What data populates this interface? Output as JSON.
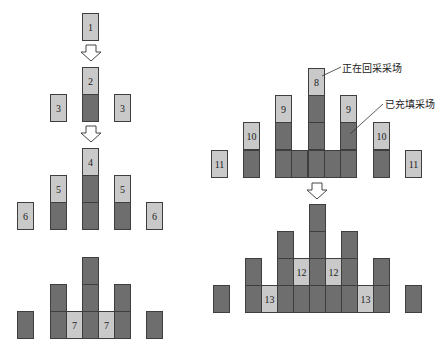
{
  "colors": {
    "active_stope": "#c9c9c9",
    "filled_stope": "#6e6e6e",
    "border": "#3e3e3e"
  },
  "left_diagram": {
    "stage1": {
      "cells": [
        {
          "x": 82,
          "y": 13,
          "fill": "light",
          "label": "1"
        }
      ]
    },
    "stage2": {
      "cells": [
        {
          "x": 82,
          "y": 67,
          "fill": "light",
          "label": "2"
        },
        {
          "x": 82,
          "y": 94,
          "fill": "dark",
          "label": ""
        },
        {
          "x": 50,
          "y": 94,
          "fill": "light",
          "label": "3"
        },
        {
          "x": 114,
          "y": 94,
          "fill": "light",
          "label": "3"
        }
      ]
    },
    "stage3": {
      "cells": [
        {
          "x": 82,
          "y": 148,
          "fill": "light",
          "label": "4"
        },
        {
          "x": 82,
          "y": 175,
          "fill": "dark",
          "label": ""
        },
        {
          "x": 82,
          "y": 202,
          "fill": "dark",
          "label": ""
        },
        {
          "x": 50,
          "y": 175,
          "fill": "light",
          "label": "5"
        },
        {
          "x": 50,
          "y": 202,
          "fill": "dark",
          "label": ""
        },
        {
          "x": 114,
          "y": 175,
          "fill": "light",
          "label": "5"
        },
        {
          "x": 114,
          "y": 202,
          "fill": "dark",
          "label": ""
        },
        {
          "x": 17,
          "y": 202,
          "fill": "light",
          "label": "6"
        },
        {
          "x": 146,
          "y": 202,
          "fill": "light",
          "label": "6"
        }
      ]
    },
    "stage4": {
      "cells": [
        {
          "x": 82,
          "y": 257,
          "fill": "dark",
          "label": ""
        },
        {
          "x": 82,
          "y": 284,
          "fill": "dark",
          "label": ""
        },
        {
          "x": 82,
          "y": 311,
          "fill": "dark",
          "label": ""
        },
        {
          "x": 50,
          "y": 284,
          "fill": "dark",
          "label": ""
        },
        {
          "x": 50,
          "y": 311,
          "fill": "dark",
          "label": ""
        },
        {
          "x": 114,
          "y": 284,
          "fill": "dark",
          "label": ""
        },
        {
          "x": 114,
          "y": 311,
          "fill": "dark",
          "label": ""
        },
        {
          "x": 66,
          "y": 311,
          "fill": "light",
          "label": "7"
        },
        {
          "x": 98,
          "y": 311,
          "fill": "light",
          "label": "7"
        },
        {
          "x": 17,
          "y": 311,
          "fill": "dark",
          "label": ""
        },
        {
          "x": 146,
          "y": 311,
          "fill": "dark",
          "label": ""
        }
      ]
    },
    "arrows": [
      {
        "x": 80,
        "y": 44
      },
      {
        "x": 80,
        "y": 125
      }
    ]
  },
  "right_diagram": {
    "stage1": {
      "cells": [
        {
          "x": 308,
          "y": 68,
          "fill": "light",
          "label": "8"
        },
        {
          "x": 308,
          "y": 95,
          "fill": "dark",
          "label": ""
        },
        {
          "x": 308,
          "y": 122,
          "fill": "dark",
          "label": ""
        },
        {
          "x": 308,
          "y": 150,
          "fill": "dark",
          "label": ""
        },
        {
          "x": 275,
          "y": 95,
          "fill": "light",
          "label": "9"
        },
        {
          "x": 275,
          "y": 122,
          "fill": "dark",
          "label": ""
        },
        {
          "x": 275,
          "y": 150,
          "fill": "dark",
          "label": ""
        },
        {
          "x": 340,
          "y": 95,
          "fill": "light",
          "label": "9"
        },
        {
          "x": 340,
          "y": 122,
          "fill": "dark",
          "label": ""
        },
        {
          "x": 340,
          "y": 150,
          "fill": "dark",
          "label": ""
        },
        {
          "x": 291,
          "y": 150,
          "fill": "dark",
          "label": ""
        },
        {
          "x": 324,
          "y": 150,
          "fill": "dark",
          "label": ""
        },
        {
          "x": 243,
          "y": 122,
          "fill": "light",
          "label": "10"
        },
        {
          "x": 243,
          "y": 150,
          "fill": "dark",
          "label": ""
        },
        {
          "x": 373,
          "y": 122,
          "fill": "light",
          "label": "10"
        },
        {
          "x": 373,
          "y": 150,
          "fill": "dark",
          "label": ""
        },
        {
          "x": 211,
          "y": 150,
          "fill": "light",
          "label": "11"
        },
        {
          "x": 405,
          "y": 150,
          "fill": "light",
          "label": "11"
        }
      ]
    },
    "stage2": {
      "cells": [
        {
          "x": 309,
          "y": 204,
          "fill": "dark",
          "label": ""
        },
        {
          "x": 309,
          "y": 231,
          "fill": "dark",
          "label": ""
        },
        {
          "x": 309,
          "y": 258,
          "fill": "dark",
          "label": ""
        },
        {
          "x": 309,
          "y": 285,
          "fill": "dark",
          "label": ""
        },
        {
          "x": 277,
          "y": 231,
          "fill": "dark",
          "label": ""
        },
        {
          "x": 277,
          "y": 258,
          "fill": "dark",
          "label": ""
        },
        {
          "x": 277,
          "y": 285,
          "fill": "dark",
          "label": ""
        },
        {
          "x": 341,
          "y": 231,
          "fill": "dark",
          "label": ""
        },
        {
          "x": 341,
          "y": 258,
          "fill": "dark",
          "label": ""
        },
        {
          "x": 341,
          "y": 285,
          "fill": "dark",
          "label": ""
        },
        {
          "x": 293,
          "y": 258,
          "fill": "light",
          "label": "12"
        },
        {
          "x": 325,
          "y": 258,
          "fill": "light",
          "label": "12"
        },
        {
          "x": 293,
          "y": 285,
          "fill": "dark",
          "label": ""
        },
        {
          "x": 325,
          "y": 285,
          "fill": "dark",
          "label": ""
        },
        {
          "x": 245,
          "y": 258,
          "fill": "dark",
          "label": ""
        },
        {
          "x": 245,
          "y": 285,
          "fill": "dark",
          "label": ""
        },
        {
          "x": 373,
          "y": 258,
          "fill": "dark",
          "label": ""
        },
        {
          "x": 373,
          "y": 285,
          "fill": "dark",
          "label": ""
        },
        {
          "x": 261,
          "y": 285,
          "fill": "light",
          "label": "13"
        },
        {
          "x": 357,
          "y": 285,
          "fill": "light",
          "label": "13"
        },
        {
          "x": 213,
          "y": 285,
          "fill": "dark",
          "label": ""
        },
        {
          "x": 405,
          "y": 285,
          "fill": "dark",
          "label": ""
        }
      ]
    },
    "arrows": [
      {
        "x": 306,
        "y": 182
      }
    ]
  },
  "annotations": {
    "active_stope_label": "正在回采采场",
    "filled_stope_label": "已充填采场"
  }
}
